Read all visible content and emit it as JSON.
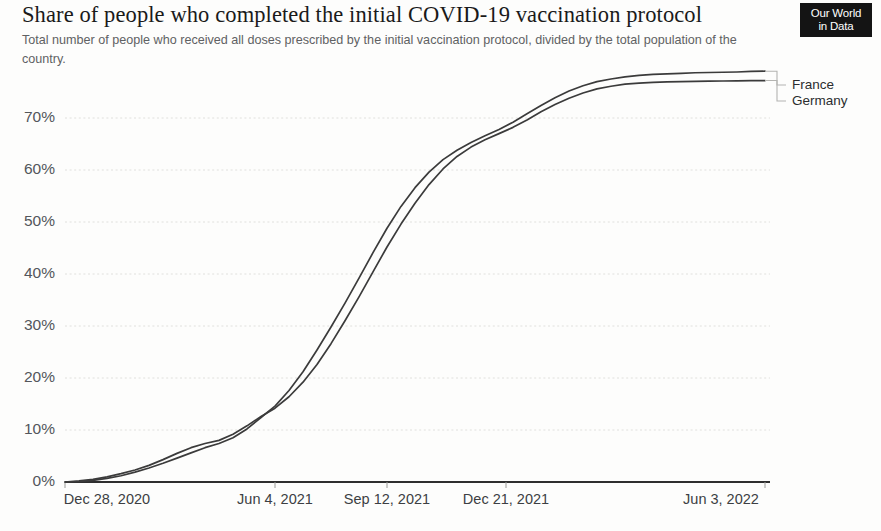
{
  "header": {
    "title": "Share of people who completed the initial COVID-19 vaccination protocol",
    "subtitle": "Total number of people who received all doses prescribed by the initial vaccination protocol, divided by the total population of the country."
  },
  "logo": {
    "line1": "Our World",
    "line2": "in Data"
  },
  "chart_data": {
    "type": "line",
    "title": "Share of people who completed the initial COVID-19 vaccination protocol",
    "subtitle": "Total number of people who received all doses prescribed by the initial vaccination protocol, divided by the total population of the country.",
    "xlabel": "",
    "ylabel": "",
    "ylim": [
      0,
      80
    ],
    "ytick_values": [
      0,
      10,
      20,
      30,
      40,
      50,
      60,
      70
    ],
    "ytick_labels": [
      "0%",
      "10%",
      "20%",
      "30%",
      "40%",
      "50%",
      "60%",
      "70%"
    ],
    "xtick_labels": [
      "Dec 28, 2020",
      "Jun 4, 2021",
      "Sep 12, 2021",
      "Dec 21, 2021",
      "Jun 3, 2022"
    ],
    "xtick_positions": [
      0,
      0.3,
      0.46,
      0.63,
      1.0
    ],
    "grid": true,
    "legend_position": "right-inline",
    "unit": "%",
    "x": [
      0,
      0.02,
      0.04,
      0.06,
      0.08,
      0.1,
      0.12,
      0.14,
      0.16,
      0.18,
      0.2,
      0.22,
      0.24,
      0.26,
      0.28,
      0.3,
      0.32,
      0.34,
      0.36,
      0.38,
      0.4,
      0.42,
      0.44,
      0.46,
      0.48,
      0.5,
      0.52,
      0.54,
      0.56,
      0.58,
      0.6,
      0.62,
      0.64,
      0.66,
      0.68,
      0.7,
      0.72,
      0.74,
      0.76,
      0.78,
      0.8,
      0.82,
      0.84,
      0.86,
      0.88,
      0.9,
      0.92,
      0.94,
      0.96,
      0.98,
      1.0
    ],
    "series": [
      {
        "name": "France",
        "color": "#3b3b3b",
        "end_value": 79.0,
        "values": [
          0.0,
          0.1,
          0.3,
          0.7,
          1.2,
          1.9,
          2.7,
          3.6,
          4.6,
          5.6,
          6.6,
          7.4,
          8.5,
          10.2,
          12.4,
          14.6,
          17.6,
          21.2,
          25.4,
          29.8,
          34.4,
          39.2,
          44.1,
          48.8,
          53.0,
          56.6,
          59.6,
          62.0,
          63.8,
          65.3,
          66.6,
          67.8,
          69.2,
          70.8,
          72.4,
          73.9,
          75.2,
          76.2,
          77.0,
          77.5,
          77.9,
          78.2,
          78.4,
          78.5,
          78.6,
          78.7,
          78.75,
          78.8,
          78.85,
          78.95,
          79.0
        ]
      },
      {
        "name": "Germany",
        "color": "#3b3b3b",
        "end_value": 77.2,
        "values": [
          0.0,
          0.2,
          0.5,
          1.0,
          1.6,
          2.3,
          3.2,
          4.3,
          5.5,
          6.6,
          7.4,
          8.0,
          9.2,
          10.8,
          12.6,
          14.2,
          16.4,
          19.2,
          22.6,
          26.6,
          31.0,
          35.6,
          40.4,
          45.2,
          49.6,
          53.6,
          57.2,
          60.2,
          62.6,
          64.4,
          65.8,
          67.0,
          68.2,
          69.6,
          71.2,
          72.6,
          73.8,
          74.8,
          75.6,
          76.1,
          76.5,
          76.7,
          76.85,
          76.95,
          77.0,
          77.05,
          77.1,
          77.12,
          77.15,
          77.18,
          77.2
        ]
      }
    ]
  }
}
